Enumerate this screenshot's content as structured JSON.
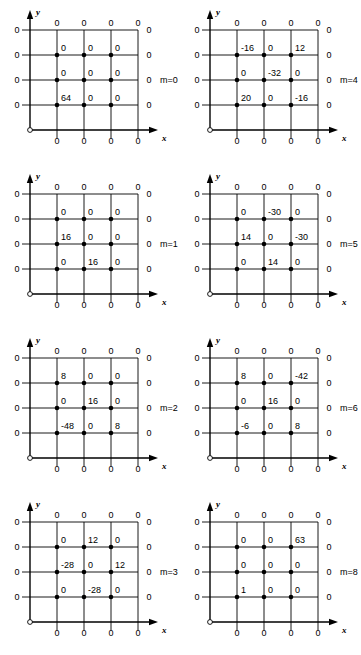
{
  "figure": {
    "type": "grid-stencil-panel-array",
    "panel_count": 8,
    "columns": 2,
    "rows": 4,
    "axis_labels": {
      "x": "x",
      "y": "y"
    },
    "boundary_value": "0",
    "grid": {
      "interior_rows": 3,
      "interior_cols": 3,
      "boundary_top_count": 4,
      "boundary_left_count": 4,
      "boundary_right_count": 4,
      "boundary_bottom_count": 4
    }
  },
  "panels": [
    {
      "id": "panel-m0",
      "label": "m=0",
      "col": 0,
      "row": 0,
      "values": [
        [
          "0",
          "0",
          "0"
        ],
        [
          "0",
          "0",
          "0"
        ],
        [
          "64",
          "0",
          "0"
        ]
      ]
    },
    {
      "id": "panel-m4",
      "label": "m=4",
      "col": 1,
      "row": 0,
      "values": [
        [
          "-16",
          "0",
          "12"
        ],
        [
          "0",
          "-32",
          "0"
        ],
        [
          "20",
          "0",
          "-16"
        ]
      ]
    },
    {
      "id": "panel-m1",
      "label": "m=1",
      "col": 0,
      "row": 1,
      "values": [
        [
          "0",
          "0",
          "0"
        ],
        [
          "16",
          "0",
          "0"
        ],
        [
          "0",
          "16",
          "0"
        ]
      ]
    },
    {
      "id": "panel-m5",
      "label": "m=5",
      "col": 1,
      "row": 1,
      "values": [
        [
          "0",
          "-30",
          "0"
        ],
        [
          "14",
          "0",
          "-30"
        ],
        [
          "0",
          "14",
          "0"
        ]
      ]
    },
    {
      "id": "panel-m2",
      "label": "m=2",
      "col": 0,
      "row": 2,
      "values": [
        [
          "8",
          "0",
          "0"
        ],
        [
          "0",
          "16",
          "0"
        ],
        [
          "-48",
          "0",
          "8"
        ]
      ]
    },
    {
      "id": "panel-m6",
      "label": "m=6",
      "col": 1,
      "row": 2,
      "values": [
        [
          "8",
          "0",
          "-42"
        ],
        [
          "0",
          "16",
          "0"
        ],
        [
          "-6",
          "0",
          "8"
        ]
      ]
    },
    {
      "id": "panel-m3",
      "label": "m=3",
      "col": 0,
      "row": 3,
      "values": [
        [
          "0",
          "12",
          "0"
        ],
        [
          "-28",
          "0",
          "12"
        ],
        [
          "0",
          "-28",
          "0"
        ]
      ]
    },
    {
      "id": "panel-m8",
      "label": "m=8",
      "col": 1,
      "row": 3,
      "values": [
        [
          "0",
          "0",
          "63"
        ],
        [
          "0",
          "0",
          "0"
        ],
        [
          "1",
          "0",
          "0"
        ]
      ]
    }
  ],
  "colors": {
    "line": "#000000",
    "node": "#000000",
    "background": "#ffffff"
  }
}
